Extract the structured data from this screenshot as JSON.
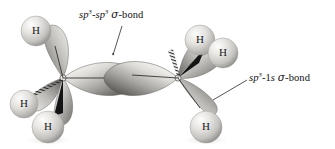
{
  "figure": {
    "background_color": "#ffffff",
    "molecule": "C2H6",
    "atom_label": "H",
    "orbital_color_light": "#e2e0dd",
    "orbital_color_mid": "#9a9894",
    "orbital_color_dark": "#5d5b58",
    "sphere_color_light": "#f2f2f0",
    "sphere_color_mid": "#cfcfcc",
    "sphere_color_dark": "#8d8d8a",
    "line_color": "#2b2b2b"
  },
  "annotations": [
    {
      "id": "sp3-sp3-sigma-bond",
      "prefix": "sp",
      "sup1": "3",
      "dash1": "-",
      "mid": "sp",
      "sup2": "3",
      "sigma": "σ",
      "suffix": "-bond",
      "full_text": "sp3-sp3 σ-bond",
      "leader_from": [
        122,
        26
      ],
      "leader_to": [
        112,
        55
      ]
    },
    {
      "id": "sp3-1s-sigma-bond",
      "prefix": "sp",
      "sup1": "3",
      "dash1": "-1",
      "mid": "s",
      "sup2": "",
      "sigma": "σ",
      "suffix": "-bond",
      "full_text": "sp3-1s σ-bond",
      "leader_from": [
        247,
        80
      ],
      "leader_to": [
        214,
        99
      ]
    }
  ],
  "hydrogens": [
    {
      "id": "h-upper-left",
      "label": "H",
      "cx": 36,
      "cy": 31,
      "r": 15
    },
    {
      "id": "h-lower-left-outer",
      "label": "H",
      "cx": 24,
      "cy": 104,
      "r": 14
    },
    {
      "id": "h-lower-left-front",
      "label": "H",
      "cx": 48,
      "cy": 127,
      "r": 16
    },
    {
      "id": "h-upper-right-back",
      "label": "H",
      "cx": 200,
      "cy": 40,
      "r": 15
    },
    {
      "id": "h-upper-right-front",
      "label": "H",
      "cx": 223,
      "cy": 53,
      "r": 15
    },
    {
      "id": "h-lower-right",
      "label": "H",
      "cx": 206,
      "cy": 127,
      "r": 16
    }
  ],
  "carbons": [
    {
      "id": "carbon-left",
      "cx": 63,
      "cy": 78
    },
    {
      "id": "carbon-right",
      "cx": 178,
      "cy": 78
    }
  ]
}
